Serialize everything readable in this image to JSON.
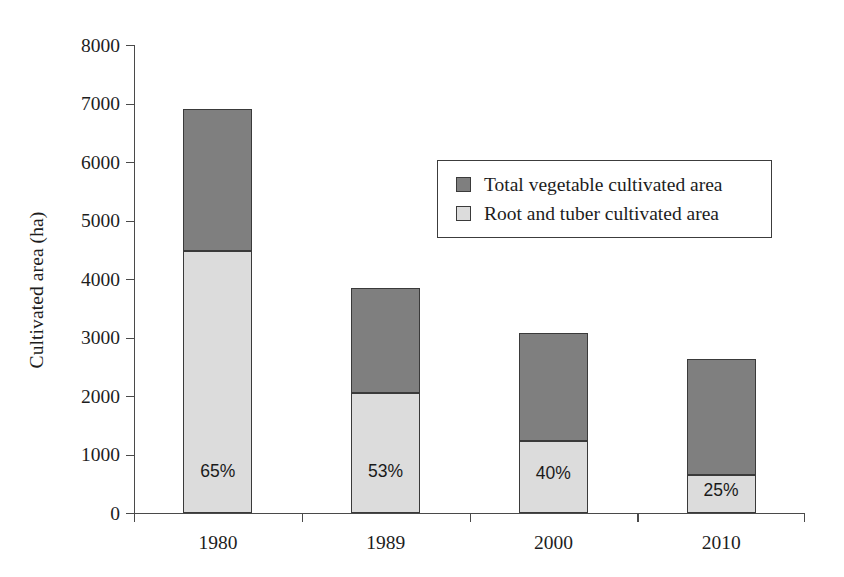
{
  "chart_data": {
    "type": "bar",
    "subtype": "stacked-bar",
    "title": "",
    "xlabel": "",
    "ylabel": "Cultivated area (ha)",
    "categories": [
      "1980",
      "1989",
      "2000",
      "2010"
    ],
    "ylim": [
      0,
      8000
    ],
    "ytick_values": [
      0,
      1000,
      2000,
      3000,
      4000,
      5000,
      6000,
      7000,
      8000
    ],
    "ytick_labels": [
      "0",
      "1000",
      "2000",
      "3000",
      "4000",
      "5000",
      "6000",
      "7000",
      "8000"
    ],
    "grid": false,
    "legend_position": "inside-upper-right",
    "series": [
      {
        "name": "Root and tuber cultivated area",
        "color": "#dcdcdc",
        "stack_order": "bottom",
        "values": [
          4480,
          2060,
          1230,
          655
        ]
      },
      {
        "name": "Total vegetable cultivated area",
        "color": "#7f7f7f",
        "stack_order": "top",
        "values": [
          2420,
          1790,
          1850,
          1975
        ]
      }
    ],
    "totals": [
      6900,
      3850,
      3080,
      2630
    ],
    "annotations": [
      {
        "category": "1980",
        "text": "65%"
      },
      {
        "category": "1989",
        "text": "53%"
      },
      {
        "category": "2000",
        "text": "40%"
      },
      {
        "category": "2010",
        "text": "25%"
      }
    ]
  },
  "legend": {
    "items": [
      {
        "label": "Total vegetable cultivated area",
        "color": "#7f7f7f"
      },
      {
        "label": "Root and tuber cultivated area",
        "color": "#dcdcdc"
      }
    ]
  },
  "colors": {
    "vegetable": "#7f7f7f",
    "root_tuber": "#dcdcdc",
    "axis": "#4a4a4a",
    "text": "#1d1d1d",
    "background": "#ffffff"
  }
}
